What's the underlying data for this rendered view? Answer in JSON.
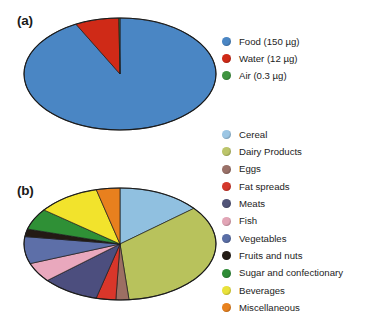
{
  "figure": {
    "panel_a_label": "(a)",
    "panel_b_label": "(b)"
  },
  "chart_data": [
    {
      "type": "pie",
      "id": "panel-a",
      "title": "(a)",
      "legend_position": "right",
      "categories": [
        "Food (150 µg)",
        "Water (12 µg)",
        "Air (0.3 µg)"
      ],
      "names": [
        "Food",
        "Water",
        "Air"
      ],
      "values": [
        150,
        12,
        0.3
      ],
      "units": "µg",
      "percentages": [
        92.42,
        7.39,
        0.18
      ],
      "colors": [
        "#4a86c4",
        "#cf2a17",
        "#3f9440"
      ],
      "start_angle_deg": 0,
      "direction": "clockwise"
    },
    {
      "type": "pie",
      "id": "panel-b",
      "title": "(b)",
      "legend_position": "right",
      "categories": [
        "Cereal",
        "Dairy Products",
        "Eggs",
        "Fat spreads",
        "Meats",
        "Fish",
        "Vegetables",
        "Fruits and nuts",
        " Sugar and confectionary",
        "Beverages",
        "Miscellaneous"
      ],
      "values": [
        14.0,
        34.5,
        2.2,
        3.3,
        9.7,
        5.6,
        7.8,
        2.2,
        6.1,
        10.6,
        4.0
      ],
      "percentages": [
        14.0,
        34.5,
        2.2,
        3.3,
        9.7,
        5.6,
        7.8,
        2.2,
        6.1,
        10.6,
        4.0
      ],
      "angles_deg": [
        50.4,
        124.2,
        7.9,
        11.9,
        34.9,
        20.2,
        28.1,
        7.9,
        22.0,
        38.2,
        14.3
      ],
      "colors": [
        "#90c0e0",
        "#b8c25c",
        "#9c6f63",
        "#d9362a",
        "#4c4e7e",
        "#e9a8bd",
        "#5d6fa8",
        "#231a14",
        "#2f9036",
        "#f2e32c",
        "#e8801e"
      ],
      "start_angle_deg": 0,
      "direction": "clockwise"
    }
  ],
  "legend_a": {
    "items": [
      {
        "label": "Food (150 µg)",
        "color": "#4a86c4"
      },
      {
        "label": "Water (12 µg)",
        "color": "#cf2a17"
      },
      {
        "label": "Air (0.3 µg)",
        "color": "#3f9440"
      }
    ]
  },
  "legend_b": {
    "items": [
      {
        "label": "Cereal",
        "color": "#9cc6e4"
      },
      {
        "label": "Dairy Products",
        "color": "#bcc56a"
      },
      {
        "label": "Eggs",
        "color": "#9a7168"
      },
      {
        "label": "Fat spreads",
        "color": "#d4382c"
      },
      {
        "label": "Meats",
        "color": "#515478"
      },
      {
        "label": "Fish",
        "color": "#e2a5b6"
      },
      {
        "label": "Vegetables",
        "color": "#5a6ea6"
      },
      {
        "label": "Fruits and nuts",
        "color": "#241c16"
      },
      {
        "label": " Sugar and confectionary",
        "color": "#2e8c36"
      },
      {
        "label": "Beverages",
        "color": "#e9e23a"
      },
      {
        "label": "Miscellaneous",
        "color": "#e8821f"
      }
    ]
  }
}
